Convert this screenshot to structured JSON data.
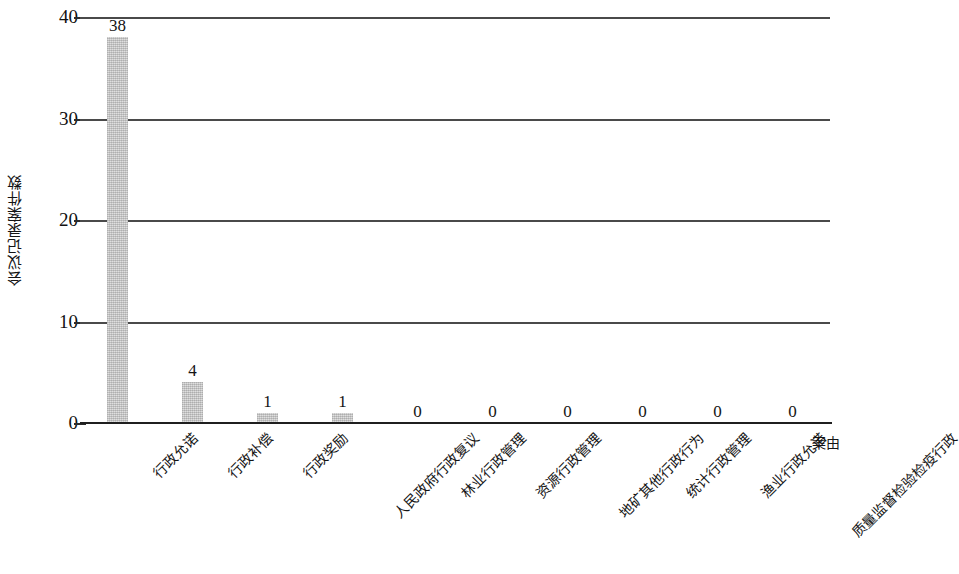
{
  "chart_data": {
    "type": "bar",
    "title": "",
    "xlabel": "案由",
    "ylabel": "会议记录案件数",
    "ylim": [
      0,
      40
    ],
    "yticks": [
      "0",
      "10",
      "20",
      "30",
      "40"
    ],
    "ytick_values": [
      0,
      10,
      20,
      30,
      40
    ],
    "grid": true,
    "legend": "none",
    "bar_color": "#c9c9c9",
    "categories": [
      "行政允诺",
      "行政补偿",
      "行政奖励",
      "人民政府行政复议",
      "林业行政管理",
      "资源行政管理",
      "地矿其他行政行为",
      "统计行政管理",
      "渔业行政允诺",
      "质量监督检验检疫行政"
    ],
    "values": [
      38,
      4,
      1,
      1,
      0,
      0,
      0,
      0,
      0,
      0
    ],
    "value_labels": [
      "38",
      "4",
      "1",
      "1",
      "0",
      "0",
      "0",
      "0",
      "0",
      "0"
    ]
  }
}
